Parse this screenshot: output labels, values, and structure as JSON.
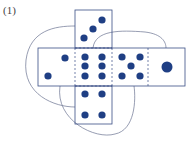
{
  "problem_label": "(1)",
  "colors": {
    "pip": "#1f3f84",
    "outline": "#3a4f86",
    "arc": "#6a7390"
  },
  "net": {
    "description": "Unfolded die net (cross shape) with curved connectors showing adjacent faces",
    "faces": [
      {
        "name": "top",
        "pips": 3
      },
      {
        "name": "left",
        "pips": 2
      },
      {
        "name": "center",
        "pips": 6
      },
      {
        "name": "right-inner",
        "pips": 5
      },
      {
        "name": "right-outer",
        "pips": 1
      },
      {
        "name": "bottom",
        "pips": 4
      }
    ]
  }
}
